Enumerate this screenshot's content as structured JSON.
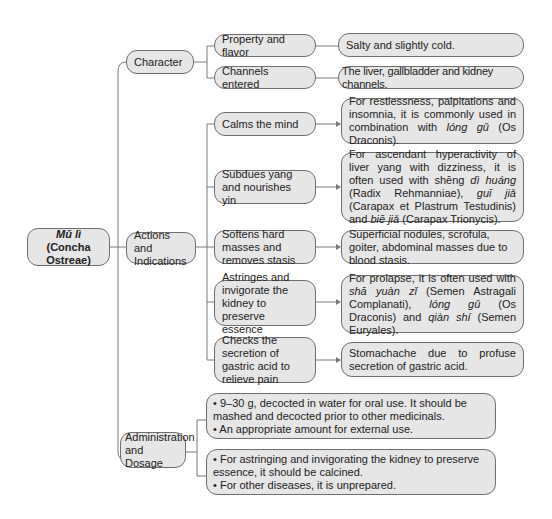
{
  "root": {
    "title_italic": "Mǔ lì",
    "subtitle": "(Concha Ostreae)"
  },
  "branches": {
    "character": {
      "label": "Character",
      "items": [
        {
          "label": "Property and flavor",
          "detail": "Salty and slightly cold."
        },
        {
          "label": "Channels entered",
          "detail": "The liver, gallbladder and kidney channels."
        }
      ]
    },
    "actions": {
      "label": "Actions and Indications",
      "items": [
        {
          "label": "Calms the mind",
          "detail_parts": [
            "For restlessness, palpitations and insomnia, it is commonly used in combination with ",
            "lóng gǔ",
            " (Os Draconis)."
          ]
        },
        {
          "label": "Subdues yang and nourishes yin",
          "detail_parts": [
            "For ascendant hyperactivity of liver yang with dizziness, it is often used with shēng ",
            "dì huáng",
            " (Radix Rehmanniae), ",
            "guī jiǎ",
            " (Carapax et Plastrum Testudinis) and ",
            "biē jiǎ",
            " (Carapax Trionycis)."
          ]
        },
        {
          "label": "Softens hard masses and removes stasis",
          "detail": "Superficial nodules, scrofula, goiter, abdominal masses due to blood stasis."
        },
        {
          "label": "Astringes and invigorate the kidney to preserve essence",
          "detail_parts": [
            "For prolapse, it is often used with ",
            "shā yuàn zǐ",
            " (Semen Astragali Complanati), ",
            "lóng gǔ",
            " (Os Draconis) and ",
            "qiàn shí",
            " (Semen Euryales)."
          ]
        },
        {
          "label": "Checks the secretion of gastric acid to relieve pain",
          "detail": "Stomachache due to profuse secretion of gastric acid."
        }
      ]
    },
    "administration": {
      "label": "Administration and Dosage",
      "items": [
        {
          "bullets": [
            "• 9–30 g, decocted in water for oral use. It should be mashed and decocted prior to other medicinals.",
            "• An appropriate amount for external use."
          ]
        },
        {
          "bullets": [
            "• For astringing and invigorating the kidney to preserve essence, it should be calcined.",
            "• For other diseases, it is unprepared."
          ]
        }
      ]
    }
  },
  "colors": {
    "node_fill": "#e6e6e6",
    "node_border": "#6f6f6f",
    "line": "#7a7a7a"
  }
}
